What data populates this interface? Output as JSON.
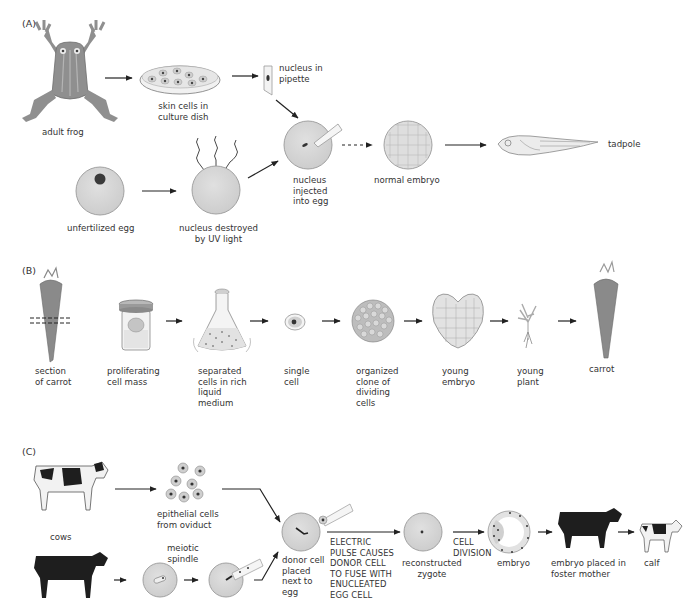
{
  "figure": {
    "panel_a": {
      "label": "(A)",
      "steps": {
        "adult_frog": "adult frog",
        "skin_cells": "skin cells in\nculture dish",
        "nucleus_pipette": "nucleus in\npipette",
        "unfertilized_egg": "unfertilized egg",
        "nucleus_destroyed": "nucleus destroyed\nby UV light",
        "nucleus_injected": "nucleus\ninjected\ninto egg",
        "normal_embryo": "normal embryo",
        "tadpole": "tadpole"
      }
    },
    "panel_b": {
      "label": "(B)",
      "steps": {
        "section_carrot": "section\nof carrot",
        "proliferating": "proliferating\ncell mass",
        "separated_cells": "separated\ncells in rich\nliquid\nmedium",
        "single_cell": "single\ncell",
        "organized_clone": "organized\nclone of\ndividing\ncells",
        "young_embryo": "young\nembryo",
        "young_plant": "young\nplant",
        "carrot": "carrot"
      }
    },
    "panel_c": {
      "label": "(C)",
      "steps": {
        "cows": "cows",
        "epithelial": "epithelial cells\nfrom oviduct",
        "meiotic_spindle": "meiotic\nspindle",
        "donor_cell": "donor cell\nplaced\nnext to\negg",
        "electric_pulse": "ELECTRIC\nPULSE CAUSES\nDONOR CELL\nTO FUSE WITH\nENUCLEATED\nEGG CELL",
        "reconstructed": "reconstructed\nzygote",
        "cell_division": "CELL\nDIVISION",
        "embryo": "embryo",
        "foster": "embryo placed in\nfoster mother",
        "calf": "calf"
      }
    },
    "colors": {
      "cell_fill": "#d6d6d6",
      "cell_stroke": "#9a9a9a",
      "nucleus": "#3a3a3a",
      "frog": "#8f8f8f",
      "carrot": "#8a8a8a",
      "arrow": "#222222",
      "cow_black": "#1e1e1e"
    }
  }
}
